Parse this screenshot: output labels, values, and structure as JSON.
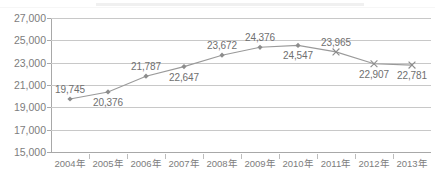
{
  "chart_data": {
    "type": "line",
    "title": "",
    "subtitle": "",
    "xlabel": "",
    "ylabel": "",
    "categories": [
      "2004年",
      "2005年",
      "2006年",
      "2007年",
      "2008年",
      "2009年",
      "2010年",
      "2011年",
      "2012年",
      "2013年"
    ],
    "values": [
      19745,
      20376,
      21787,
      22647,
      23672,
      24376,
      24547,
      23965,
      22907,
      22781
    ],
    "data_labels": [
      "19,745",
      "20,376",
      "21,787",
      "22,647",
      "23,672",
      "24,376",
      "24,547",
      "23,965",
      "22,907",
      "22,781"
    ],
    "label_positions": [
      "above",
      "below",
      "above",
      "below",
      "above",
      "above",
      "below",
      "above",
      "below",
      "below"
    ],
    "markers": [
      "diamond",
      "diamond",
      "diamond",
      "diamond",
      "diamond",
      "diamond",
      "diamond",
      "cross",
      "cross",
      "cross"
    ],
    "ylim": [
      15000,
      27000
    ],
    "ytick_step": 2000,
    "ytick_labels": [
      "27,000",
      "25,000",
      "23,000",
      "21,000",
      "19,000",
      "17,000",
      "15,000"
    ],
    "ytick_values": [
      27000,
      25000,
      23000,
      21000,
      19000,
      17000,
      15000
    ],
    "grid": true,
    "legend": false,
    "legend_position": "none",
    "series": [
      {
        "name": "",
        "values": [
          19745,
          20376,
          21787,
          22647,
          23672,
          24376,
          24547,
          23965,
          22907,
          22781
        ]
      }
    ],
    "colors": {
      "line": "#9a9a9a",
      "marker": "#8d8d8d",
      "gridline": "#c8c8c8",
      "axis": "#a8a8a8",
      "tick_text": "#7d7d7d",
      "label_text": "#6f6f6f",
      "background": "#ffffff"
    }
  }
}
